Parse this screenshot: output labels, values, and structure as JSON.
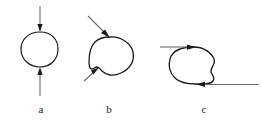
{
  "figure": {
    "caption_labels": [
      {
        "id": "a",
        "text": "a"
      },
      {
        "id": "b",
        "text": "b"
      },
      {
        "id": "c",
        "text": "c"
      }
    ],
    "colors": {
      "ink": "#1a1a1a",
      "stroke_light": "#555555",
      "background": "#ffffff"
    },
    "panels": [
      {
        "id": "a",
        "name": "closed-loop-vertical-arrows",
        "description": "Oval closed loop with one arrow entering vertically from the top and one arrow entering vertically from the bottom",
        "loop_path": "M 40 32 C 52 32 58 40 58 49 C 58 59 51 67 40 67 C 29 67 21 59 21 49 C 21 40 28 32 40 32 Z",
        "arrows": [
          {
            "name": "top-arrow-down",
            "x1": 40,
            "y1": 6,
            "x2": 40,
            "y2": 31,
            "head": "down"
          },
          {
            "name": "bottom-arrow-up",
            "x1": 40,
            "y1": 96,
            "x2": 40,
            "y2": 68,
            "head": "up"
          }
        ]
      },
      {
        "id": "b",
        "name": "blob-loop-diagonal-arrows",
        "description": "Irregular blob loop with a notch at lower left; one arrow enters diagonally from upper left, one enters diagonally from lower left",
        "loop_path": "M 110 37 C 120 36 131 43 133 52 C 135 61 130 69 121 73 C 113 77 106 75 102 71 C 100 69 99 67 97 67 C 95 67 94 69 92 69 C 90 69 89 66 89 62 C 89 55 90 47 95 42 C 99 38 105 37 110 37 Z",
        "arrows": [
          {
            "name": "upper-left-arrow",
            "x1": 89,
            "y1": 17,
            "x2": 108,
            "y2": 36,
            "head": "down-right"
          },
          {
            "name": "lower-left-arrow",
            "x1": 85,
            "y1": 80,
            "x2": 98,
            "y2": 69,
            "head": "up-right"
          }
        ]
      },
      {
        "id": "c",
        "name": "blob-loop-horizontal-arrows",
        "description": "Irregular blob loop with a wavy right edge; one arrow enters horizontally from the left at the top, one enters horizontally from the right at the bottom",
        "loop_path": "M 194 47 C 203 47 211 52 214 59 C 216 64 211 67 211 71 C 211 75 216 77 213 81 C 210 85 203 84 196 84 C 188 84 180 83 175 78 C 170 73 168 66 170 59 C 172 52 180 47 194 47 Z",
        "arrows": [
          {
            "name": "left-arrow-right",
            "x1": 160,
            "y1": 47,
            "x2": 193,
            "y2": 47,
            "head": "right"
          },
          {
            "name": "right-arrow-left",
            "x1": 258,
            "y1": 84,
            "x2": 197,
            "y2": 84,
            "head": "left"
          }
        ]
      }
    ]
  }
}
